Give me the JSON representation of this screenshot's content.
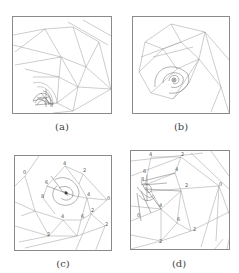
{
  "figure": {
    "panels": [
      {
        "id": "a",
        "caption": "(a)"
      },
      {
        "id": "b",
        "caption": "(b)"
      },
      {
        "id": "c",
        "caption": "(c)",
        "labels": [
          "4",
          "2",
          "6",
          "0",
          "8",
          "4",
          "2",
          "0",
          "2",
          "6",
          "4",
          "2"
        ]
      },
      {
        "id": "d",
        "caption": "(d)",
        "labels": [
          "4",
          "2",
          "6",
          "0",
          "8",
          "4",
          "2",
          "0",
          "2",
          "6",
          "4",
          "2"
        ]
      }
    ]
  }
}
